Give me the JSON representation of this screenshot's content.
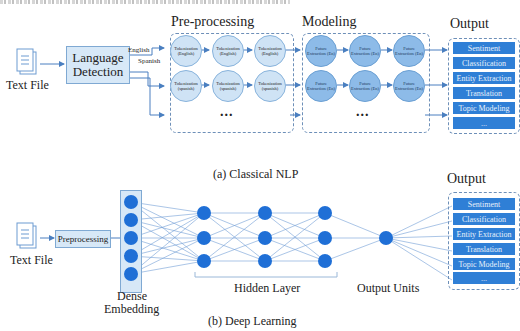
{
  "classical": {
    "caption": "(a) Classical NLP",
    "input_label": "Text File",
    "language_detection": [
      "Language",
      "Detection"
    ],
    "branch_labels": [
      "English",
      "Spanish"
    ],
    "preprocessing": {
      "title": "Pre-processing",
      "rows": [
        [
          "Tokenization (English)",
          "Tokenization (English)",
          "Tokenization (English)"
        ],
        [
          "Tokenization (spanish)",
          "Tokenization (spanish)",
          "Tokenization (spanish)"
        ]
      ],
      "ellipsis": "..."
    },
    "modeling": {
      "title": "Modeling",
      "rows": [
        [
          "Future Extraction (En)",
          "Future Extraction (En)",
          "Future Extraction (En)"
        ],
        [
          "Future Extraction (En)",
          "Future Extraction (En)",
          "Future Extraction (En)"
        ]
      ],
      "ellipsis": "..."
    },
    "output": {
      "title": "Output",
      "items": [
        "Sentiment",
        "Classification",
        "Entity Extraction",
        "Translation",
        "Topic Modeling",
        "..."
      ]
    }
  },
  "deep": {
    "caption": "(b) Deep Learning",
    "input_label": "Text File",
    "preprocessing_label": "Preprocessing",
    "embedding_label": [
      "Dense",
      "Embedding"
    ],
    "hidden_label": "Hidden Layer",
    "output_units_label": "Output Units",
    "output": {
      "title": "Output",
      "items": [
        "Sentiment",
        "Classification",
        "Entity Extraction",
        "Translation",
        "Topic Modeling",
        "..."
      ]
    }
  },
  "colors": {
    "light_fill": "#d7e8f7",
    "node_blue": "#1f6fd6",
    "output_blue": "#2f7fd6",
    "line_blue": "#4a7fc0"
  }
}
